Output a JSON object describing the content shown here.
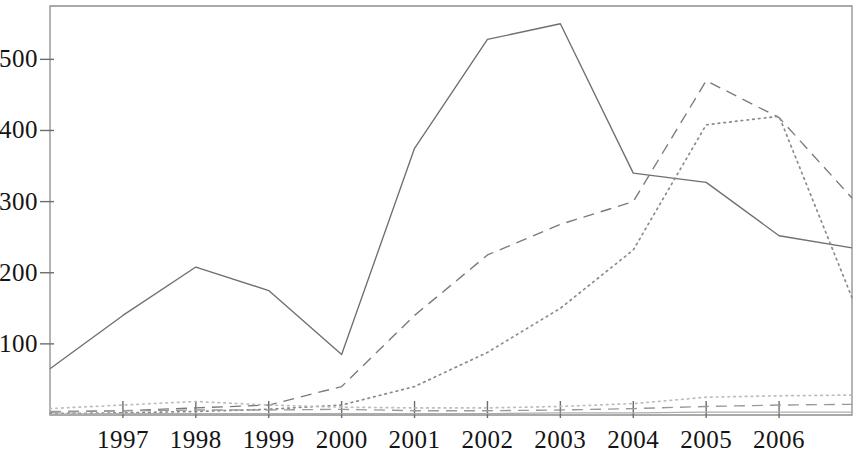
{
  "chart_data": {
    "type": "line",
    "title": "",
    "subtitle": "",
    "xlabel": "",
    "ylabel": "",
    "x": [
      1996,
      1997,
      1998,
      1999,
      2000,
      2001,
      2002,
      2003,
      2004,
      2005,
      2006,
      2007
    ],
    "xlim": [
      1996,
      2007
    ],
    "ylim": [
      0,
      575
    ],
    "grid": false,
    "legend": "none",
    "x_tick_labels": [
      "1997",
      "1998",
      "1999",
      "2000",
      "2001",
      "2002",
      "2003",
      "2004",
      "2005",
      "2006"
    ],
    "x_tick_values": [
      1997,
      1998,
      1999,
      2000,
      2001,
      2002,
      2003,
      2004,
      2005,
      2006
    ],
    "y_tick_labels": [
      "100",
      "200",
      "300",
      "400",
      "500"
    ],
    "y_tick_values": [
      100,
      200,
      300,
      400,
      500
    ],
    "series": [
      {
        "name": "series-1",
        "style": "solid",
        "color": "#6f6f6f",
        "values": [
          65,
          140,
          208,
          175,
          85,
          375,
          528,
          550,
          340,
          327,
          252,
          235
        ]
      },
      {
        "name": "series-2",
        "style": "dashed",
        "color": "#7a7a7a",
        "values": [
          4,
          6,
          10,
          14,
          40,
          140,
          225,
          268,
          300,
          470,
          418,
          305
        ]
      },
      {
        "name": "series-3",
        "style": "dotted",
        "color": "#8a8a8a",
        "values": [
          2,
          3,
          5,
          8,
          14,
          40,
          88,
          150,
          232,
          408,
          420,
          165
        ]
      },
      {
        "name": "series-4",
        "style": "dotted",
        "color": "#bdbdbd",
        "values": [
          9,
          14,
          19,
          14,
          11,
          10,
          10,
          12,
          16,
          25,
          27,
          28
        ]
      },
      {
        "name": "series-5",
        "style": "dashed",
        "color": "#9a9a9a",
        "values": [
          5,
          6,
          7,
          7,
          8,
          6,
          6,
          7,
          9,
          12,
          14,
          15
        ]
      },
      {
        "name": "series-6",
        "style": "solid",
        "color": "#adadad",
        "values": [
          1,
          2,
          2,
          2,
          2,
          2,
          2,
          3,
          3,
          4,
          4,
          4
        ]
      }
    ]
  }
}
